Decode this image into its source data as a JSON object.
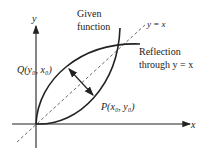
{
  "diagram": {
    "axes": {
      "x_label": "x",
      "y_label": "y"
    },
    "labels": {
      "given_function_line1": "Given",
      "given_function_line2": "function",
      "line_label": "y = x",
      "reflection_line1": "Reflection",
      "reflection_line2": "through y = x",
      "point_q": "Q(y₀, x₀)",
      "point_p": "P(x₀, y₀)"
    },
    "colors": {
      "ink": "#222222",
      "dashed": "#555555",
      "background": "#ffffff"
    }
  }
}
